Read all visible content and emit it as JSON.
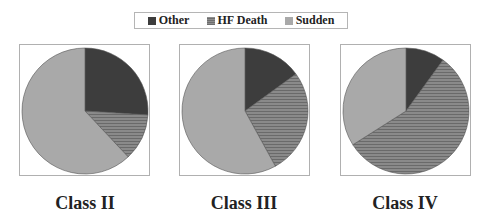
{
  "legend": {
    "items": [
      {
        "label": "Other",
        "color": "#3d3d3d",
        "pattern": "solid"
      },
      {
        "label": "HF Death",
        "color": "#7e7e7e",
        "pattern": "horizontal-stripes"
      },
      {
        "label": "Sudden",
        "color": "#a9a9a9",
        "pattern": "solid"
      }
    ]
  },
  "chart_data": [
    {
      "type": "pie",
      "title": "Class II",
      "categories": [
        "Other",
        "HF Death",
        "Sudden"
      ],
      "values": [
        26,
        12,
        62
      ],
      "start_angle": "12 o'clock, clockwise"
    },
    {
      "type": "pie",
      "title": "Class III",
      "categories": [
        "Other",
        "HF Death",
        "Sudden"
      ],
      "values": [
        15,
        27,
        58
      ],
      "start_angle": "12 o'clock, clockwise"
    },
    {
      "type": "pie",
      "title": "Class IV",
      "categories": [
        "Other",
        "HF Death",
        "Sudden"
      ],
      "values": [
        10,
        56,
        34
      ],
      "start_angle": "12 o'clock, clockwise"
    }
  ],
  "labels": {
    "class2": "Class II",
    "class3": "Class III",
    "class4": "Class IV"
  }
}
